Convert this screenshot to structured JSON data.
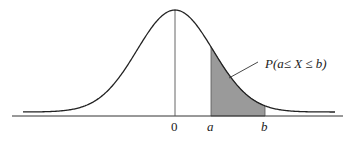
{
  "diagram": {
    "annotation": "P(a≤ X ≤ b)",
    "axis_labels": {
      "zero": "0",
      "a": "a",
      "b": "b"
    },
    "colors": {
      "curve": "#222222",
      "shade": "#9a9a9a",
      "axis": "#333333"
    }
  }
}
